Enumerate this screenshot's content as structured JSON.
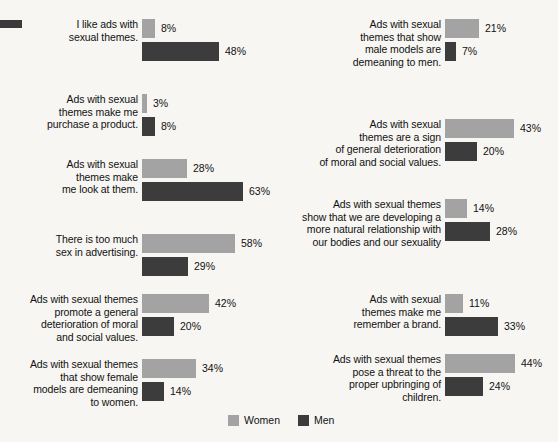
{
  "chart_data": {
    "type": "bar",
    "title": "",
    "subtitle": "",
    "xlabel": "",
    "ylabel": "",
    "orientation": "horizontal",
    "grid": false,
    "legend_position": "bottom-center",
    "value_suffix": "%",
    "xlim": [
      0,
      70
    ],
    "px_per_percent": 1.6,
    "series": [
      {
        "name": "Women",
        "color": "#a3a3a3",
        "values": [
          8,
          3,
          28,
          58,
          42,
          34,
          21,
          43,
          14,
          11,
          44
        ]
      },
      {
        "name": "Men",
        "color": "#3c3c3c",
        "values": [
          48,
          8,
          63,
          29,
          20,
          14,
          7,
          20,
          28,
          33,
          24
        ]
      }
    ],
    "categories": [
      "I like ads with\nsexual themes.",
      "Ads with sexual\nthemes make me\npurchase a product.",
      "Ads with sexual\nthemes make\nme look at them.",
      "There is too much\nsex in advertising.",
      "Ads with sexual themes\npromote a general\ndeterioration of moral\nand social values.",
      "Ads with sexual themes\nthat show female\nmodels are demeaning\nto women.",
      "Ads with sexual\nthemes that show\nmale models are\ndemeaning to men.",
      "Ads with sexual\nthemes are a sign\nof general deterioration\nof moral and social values.",
      "Ads with sexual themes\nshow that we are developing a\nmore natural relationship with\nour bodies and our sexuality",
      "Ads with sexual\nthemes make me\nremember a brand.",
      "Ads with sexual themes\npose a threat to the\nproper upbringing of\nchildren."
    ]
  },
  "legend": {
    "items": [
      {
        "label": "Women",
        "color": "#a3a3a3"
      },
      {
        "label": "Men",
        "color": "#3c3c3c"
      }
    ]
  },
  "left_column": {
    "groups": [
      {
        "label": "I like ads with\nsexual themes.",
        "women_value": "8%",
        "men_value": "48%",
        "women_pct": 8,
        "men_pct": 48
      },
      {
        "label": "Ads with sexual\nthemes make me\npurchase a product.",
        "women_value": "3%",
        "men_value": "8%",
        "women_pct": 3,
        "men_pct": 8
      },
      {
        "label": "Ads with sexual\nthemes make\nme look at them.",
        "women_value": "28%",
        "men_value": "63%",
        "women_pct": 28,
        "men_pct": 63
      },
      {
        "label": "There is too much\nsex in advertising.",
        "women_value": "58%",
        "men_value": "29%",
        "women_pct": 58,
        "men_pct": 29
      },
      {
        "label": "Ads with sexual themes\npromote a general\ndeterioration of moral\nand social values.",
        "women_value": "42%",
        "men_value": "20%",
        "women_pct": 42,
        "men_pct": 20
      },
      {
        "label": "Ads with sexual themes\nthat show female\nmodels are demeaning\nto women.",
        "women_value": "34%",
        "men_value": "14%",
        "women_pct": 34,
        "men_pct": 14
      }
    ]
  },
  "right_column": {
    "groups": [
      {
        "label": "Ads with sexual\nthemes that show\nmale models are\ndemeaning to men.",
        "women_value": "21%",
        "men_value": "7%",
        "women_pct": 21,
        "men_pct": 7
      },
      {
        "label": "Ads with sexual\nthemes are a sign\nof general deterioration\nof moral and social values.",
        "women_value": "43%",
        "men_value": "20%",
        "women_pct": 43,
        "men_pct": 20
      },
      {
        "label": "Ads with sexual themes\nshow that we are developing a\nmore natural relationship with\nour bodies and our sexuality",
        "women_value": "14%",
        "men_value": "28%",
        "women_pct": 14,
        "men_pct": 28
      },
      {
        "label": "Ads with sexual\nthemes make me\nremember a brand.",
        "women_value": "11%",
        "men_value": "33%",
        "women_pct": 11,
        "men_pct": 33
      },
      {
        "label": "Ads with sexual themes\npose a threat to the\nproper upbringing of\nchildren.",
        "women_value": "44%",
        "men_value": "24%",
        "women_pct": 44,
        "men_pct": 24
      }
    ]
  }
}
